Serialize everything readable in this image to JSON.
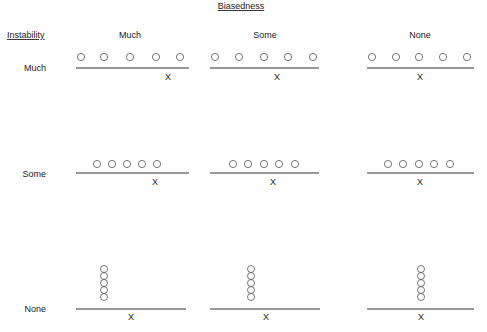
{
  "diagram": {
    "title": "Biasedness",
    "row_axis_title": "Instability",
    "column_headers": [
      {
        "label": "Much",
        "cx": 130
      },
      {
        "label": "Some",
        "cx": 265
      },
      {
        "label": "None",
        "cx": 420
      }
    ],
    "rows": [
      {
        "label": "Much",
        "label_y": 71
      },
      {
        "label": "Some",
        "label_y": 177
      },
      {
        "label": "None",
        "label_y": 312
      }
    ],
    "target_marker": "X",
    "colors": {
      "ink": "#222222",
      "circle_stroke": "#555555",
      "line": "#333333"
    },
    "cells": [
      {
        "row": "Much",
        "col": "Much",
        "line": [
          76,
          189,
          68
        ],
        "x_mark": [
          168,
          80
        ],
        "layout": "spread",
        "circles": [
          [
            81,
            57
          ],
          [
            104,
            57
          ],
          [
            130,
            57
          ],
          [
            156,
            57
          ],
          [
            180,
            57
          ]
        ]
      },
      {
        "row": "Much",
        "col": "Some",
        "line": [
          210,
          319,
          68
        ],
        "x_mark": [
          277,
          80
        ],
        "layout": "spread",
        "circles": [
          [
            215,
            57
          ],
          [
            239,
            57
          ],
          [
            264,
            57
          ],
          [
            288,
            57
          ],
          [
            313,
            57
          ]
        ]
      },
      {
        "row": "Much",
        "col": "None",
        "line": [
          367,
          474,
          68
        ],
        "x_mark": [
          420,
          80
        ],
        "layout": "spread",
        "circles": [
          [
            372,
            57
          ],
          [
            396,
            57
          ],
          [
            419,
            57
          ],
          [
            443,
            57
          ],
          [
            467,
            57
          ]
        ]
      },
      {
        "row": "Some",
        "col": "Much",
        "line": [
          76,
          189,
          173
        ],
        "x_mark": [
          155,
          185
        ],
        "layout": "clustered",
        "circles": [
          [
            97,
            164
          ],
          [
            112,
            164
          ],
          [
            127,
            164
          ],
          [
            142,
            164
          ],
          [
            157,
            164
          ]
        ]
      },
      {
        "row": "Some",
        "col": "Some",
        "line": [
          210,
          319,
          173
        ],
        "x_mark": [
          273,
          185
        ],
        "layout": "clustered",
        "circles": [
          [
            233,
            164
          ],
          [
            248,
            164
          ],
          [
            264,
            164
          ],
          [
            279,
            164
          ],
          [
            295,
            164
          ]
        ]
      },
      {
        "row": "Some",
        "col": "None",
        "line": [
          367,
          474,
          173
        ],
        "x_mark": [
          420,
          185
        ],
        "layout": "clustered",
        "circles": [
          [
            388,
            164
          ],
          [
            403,
            164
          ],
          [
            419,
            164
          ],
          [
            434,
            164
          ],
          [
            450,
            164
          ]
        ]
      },
      {
        "row": "None",
        "col": "Much",
        "line": [
          76,
          186,
          309
        ],
        "x_mark": [
          131,
          320
        ],
        "layout": "stacked",
        "circles": [
          [
            104,
            269
          ],
          [
            104,
            276
          ],
          [
            104,
            283
          ],
          [
            104,
            290
          ],
          [
            104,
            297
          ]
        ]
      },
      {
        "row": "None",
        "col": "Some",
        "line": [
          210,
          320,
          309
        ],
        "x_mark": [
          266,
          320
        ],
        "layout": "stacked",
        "circles": [
          [
            251,
            269
          ],
          [
            251,
            276
          ],
          [
            251,
            283
          ],
          [
            251,
            290
          ],
          [
            251,
            297
          ]
        ]
      },
      {
        "row": "None",
        "col": "None",
        "line": [
          367,
          474,
          309
        ],
        "x_mark": [
          421,
          320
        ],
        "layout": "stacked",
        "circles": [
          [
            421,
            269
          ],
          [
            421,
            276
          ],
          [
            421,
            283
          ],
          [
            421,
            290
          ],
          [
            421,
            297
          ]
        ]
      }
    ]
  }
}
